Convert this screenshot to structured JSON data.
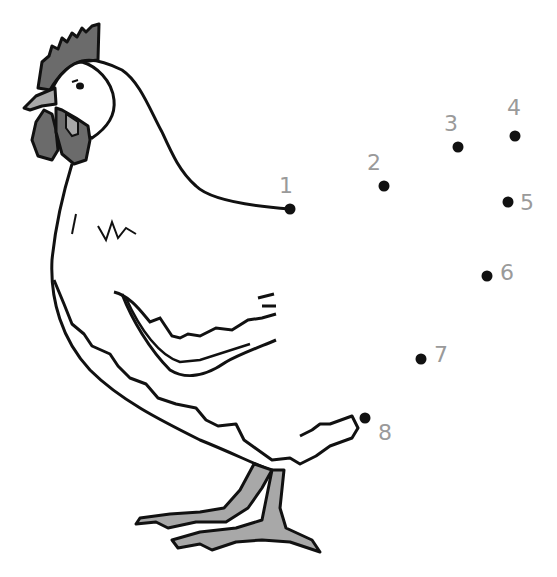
{
  "colors": {
    "outline": "#111111",
    "comb_wattle": "#6b6b6b",
    "beak_legs": "#a8a8a8",
    "dot": "#111111",
    "number": "#9a9a9a",
    "background": "#ffffff"
  },
  "dots": [
    {
      "n": "1",
      "x": 290,
      "y": 209,
      "lx": 279,
      "ly": 193
    },
    {
      "n": "2",
      "x": 384,
      "y": 186,
      "lx": 367,
      "ly": 170
    },
    {
      "n": "3",
      "x": 458,
      "y": 147,
      "lx": 444,
      "ly": 131
    },
    {
      "n": "4",
      "x": 515,
      "y": 136,
      "lx": 507,
      "ly": 115
    },
    {
      "n": "5",
      "x": 508,
      "y": 202,
      "lx": 520,
      "ly": 210
    },
    {
      "n": "6",
      "x": 487,
      "y": 276,
      "lx": 500,
      "ly": 280
    },
    {
      "n": "7",
      "x": 421,
      "y": 359,
      "lx": 434,
      "ly": 362
    },
    {
      "n": "8",
      "x": 365,
      "y": 418,
      "lx": 378,
      "ly": 440
    }
  ]
}
